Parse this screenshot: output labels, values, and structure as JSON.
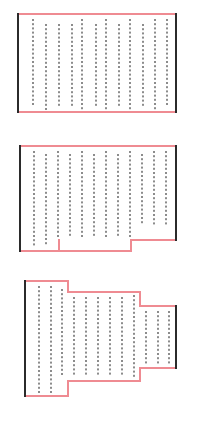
{
  "figure": {
    "type": "diagram",
    "background_color": "#ffffff",
    "canvas": {
      "width": 197,
      "height": 421
    }
  },
  "style": {
    "outline_color": "#ef8b92",
    "outline_width": 2,
    "side_edge_color": "#2b2b2b",
    "side_edge_width": 2,
    "dot_color": "#8c8c8c",
    "dot_size": 2
  },
  "panels": [
    {
      "id": "panel-1",
      "label": "Panel 1",
      "shape": "rectangle",
      "outline_path": "M 18 14 L 176 14 L 176 112 L 18 112 Z",
      "side_edges": [
        {
          "name": "left-edge",
          "x1": 18,
          "y1": 14,
          "x2": 18,
          "y2": 112
        },
        {
          "name": "right-edge",
          "x1": 176,
          "y1": 14,
          "x2": 176,
          "y2": 112
        }
      ],
      "outline_segments": [
        {
          "name": "top-edge",
          "x1": 18,
          "y1": 14,
          "x2": 176,
          "y2": 14
        },
        {
          "name": "bottom-edge",
          "x1": 18,
          "y1": 112,
          "x2": 176,
          "y2": 112
        }
      ],
      "columns": [
        {
          "x": 33,
          "y_top": 20,
          "y_bottom": 105
        },
        {
          "x": 46,
          "y_top": 25,
          "y_bottom": 109
        },
        {
          "x": 59,
          "y_top": 25,
          "y_bottom": 105
        },
        {
          "x": 72,
          "y_top": 25,
          "y_bottom": 105
        },
        {
          "x": 82,
          "y_top": 20,
          "y_bottom": 109
        },
        {
          "x": 96,
          "y_top": 25,
          "y_bottom": 105
        },
        {
          "x": 106,
          "y_top": 20,
          "y_bottom": 109
        },
        {
          "x": 119,
          "y_top": 25,
          "y_bottom": 105
        },
        {
          "x": 130,
          "y_top": 20,
          "y_bottom": 109
        },
        {
          "x": 143,
          "y_top": 25,
          "y_bottom": 105
        },
        {
          "x": 155,
          "y_top": 20,
          "y_bottom": 109
        },
        {
          "x": 167,
          "y_top": 20,
          "y_bottom": 105
        }
      ],
      "row_spacing": 4.2
    },
    {
      "id": "panel-2",
      "label": "Panel 2",
      "shape": "stepped-bottom",
      "outline_path": "M 20 146 L 176 146 L 176 240 L 131 240 L 131 251 L 59 251 L 59 240 L 20 240 Z",
      "side_edges": [
        {
          "name": "left-edge",
          "x1": 20,
          "y1": 146,
          "x2": 20,
          "y2": 251
        },
        {
          "name": "right-edge",
          "x1": 176,
          "y1": 146,
          "x2": 176,
          "y2": 240
        }
      ],
      "outline_segments": [
        {
          "name": "top-edge",
          "x1": 20,
          "y1": 146,
          "x2": 176,
          "y2": 146
        },
        {
          "name": "bottom-right-edge",
          "x1": 131,
          "y1": 240,
          "x2": 176,
          "y2": 240
        },
        {
          "name": "step-right-riser",
          "x1": 131,
          "y1": 240,
          "x2": 131,
          "y2": 251
        },
        {
          "name": "bottom-middle-edge",
          "x1": 59,
          "y1": 251,
          "x2": 131,
          "y2": 251
        },
        {
          "name": "step-left-riser",
          "x1": 59,
          "y1": 240,
          "x2": 59,
          "y2": 251
        },
        {
          "name": "bottom-left-edge",
          "x1": 20,
          "y1": 251,
          "x2": 59,
          "y2": 251
        }
      ],
      "columns": [
        {
          "x": 34,
          "y_top": 152,
          "y_bottom": 247
        },
        {
          "x": 46,
          "y_top": 155,
          "y_bottom": 247
        },
        {
          "x": 58,
          "y_top": 152,
          "y_bottom": 236
        },
        {
          "x": 70,
          "y_top": 155,
          "y_bottom": 236
        },
        {
          "x": 82,
          "y_top": 152,
          "y_bottom": 236
        },
        {
          "x": 94,
          "y_top": 155,
          "y_bottom": 236
        },
        {
          "x": 106,
          "y_top": 152,
          "y_bottom": 236
        },
        {
          "x": 118,
          "y_top": 155,
          "y_bottom": 236
        },
        {
          "x": 130,
          "y_top": 152,
          "y_bottom": 236
        },
        {
          "x": 142,
          "y_top": 155,
          "y_bottom": 225
        },
        {
          "x": 154,
          "y_top": 152,
          "y_bottom": 225
        },
        {
          "x": 166,
          "y_top": 152,
          "y_bottom": 225
        }
      ],
      "row_spacing": 4.2
    },
    {
      "id": "panel-3",
      "label": "Panel 3",
      "shape": "cross-stepped",
      "outline_path": "M 25 281 L 68 281 L 68 292 L 140 292 L 140 306 L 176 306 L 176 368 L 140 368 L 140 381 L 68 381 L 68 396 L 25 396 Z",
      "side_edges": [
        {
          "name": "left-edge",
          "x1": 25,
          "y1": 281,
          "x2": 25,
          "y2": 396
        },
        {
          "name": "right-edge",
          "x1": 176,
          "y1": 306,
          "x2": 176,
          "y2": 368
        }
      ],
      "outline_segments": [
        {
          "name": "top-left-edge",
          "x1": 25,
          "y1": 281,
          "x2": 68,
          "y2": 281
        },
        {
          "name": "top-left-riser",
          "x1": 68,
          "y1": 281,
          "x2": 68,
          "y2": 292
        },
        {
          "name": "top-middle-edge",
          "x1": 68,
          "y1": 292,
          "x2": 140,
          "y2": 292
        },
        {
          "name": "top-right-riser",
          "x1": 140,
          "y1": 292,
          "x2": 140,
          "y2": 306
        },
        {
          "name": "top-right-edge",
          "x1": 140,
          "y1": 306,
          "x2": 176,
          "y2": 306
        },
        {
          "name": "bottom-right-edge",
          "x1": 140,
          "y1": 368,
          "x2": 176,
          "y2": 368
        },
        {
          "name": "bottom-right-riser",
          "x1": 140,
          "y1": 368,
          "x2": 140,
          "y2": 381
        },
        {
          "name": "bottom-middle-edge",
          "x1": 68,
          "y1": 381,
          "x2": 140,
          "y2": 381
        },
        {
          "name": "bottom-left-riser",
          "x1": 68,
          "y1": 381,
          "x2": 68,
          "y2": 396
        },
        {
          "name": "bottom-left-edge",
          "x1": 25,
          "y1": 396,
          "x2": 68,
          "y2": 396
        }
      ],
      "columns": [
        {
          "x": 39,
          "y_top": 287,
          "y_bottom": 392
        },
        {
          "x": 51,
          "y_top": 287,
          "y_bottom": 392
        },
        {
          "x": 62,
          "y_top": 290,
          "y_bottom": 377
        },
        {
          "x": 74,
          "y_top": 298,
          "y_bottom": 377
        },
        {
          "x": 86,
          "y_top": 298,
          "y_bottom": 377
        },
        {
          "x": 98,
          "y_top": 298,
          "y_bottom": 377
        },
        {
          "x": 110,
          "y_top": 298,
          "y_bottom": 377
        },
        {
          "x": 122,
          "y_top": 298,
          "y_bottom": 377
        },
        {
          "x": 134,
          "y_top": 296,
          "y_bottom": 377
        },
        {
          "x": 146,
          "y_top": 312,
          "y_bottom": 364
        },
        {
          "x": 158,
          "y_top": 312,
          "y_bottom": 364
        },
        {
          "x": 169,
          "y_top": 312,
          "y_bottom": 364
        }
      ],
      "row_spacing": 4.2
    }
  ]
}
